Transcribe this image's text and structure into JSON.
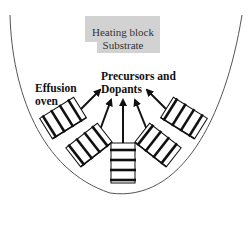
{
  "diagram": {
    "title": "",
    "heating_block": {
      "line1": "Heating block",
      "line2": "Substrate",
      "fill": "#d2d2d2"
    },
    "labels": {
      "effusion_line1": "Effusion",
      "effusion_line2": "oven",
      "precursors_line1": "Precursors and",
      "precursors_line2": "Dopants"
    },
    "ovens": [
      {
        "id": "oven-1",
        "position": "far-left",
        "coils": 4
      },
      {
        "id": "oven-2",
        "position": "left",
        "coils": 4
      },
      {
        "id": "oven-3",
        "position": "center",
        "coils": 4
      },
      {
        "id": "oven-4",
        "position": "right",
        "coils": 4
      },
      {
        "id": "oven-5",
        "position": "far-right",
        "coils": 4
      }
    ],
    "arrows_count": 5,
    "colors": {
      "line": "#111111",
      "chamber_outline": "#555555",
      "block_text": "#333333"
    }
  }
}
